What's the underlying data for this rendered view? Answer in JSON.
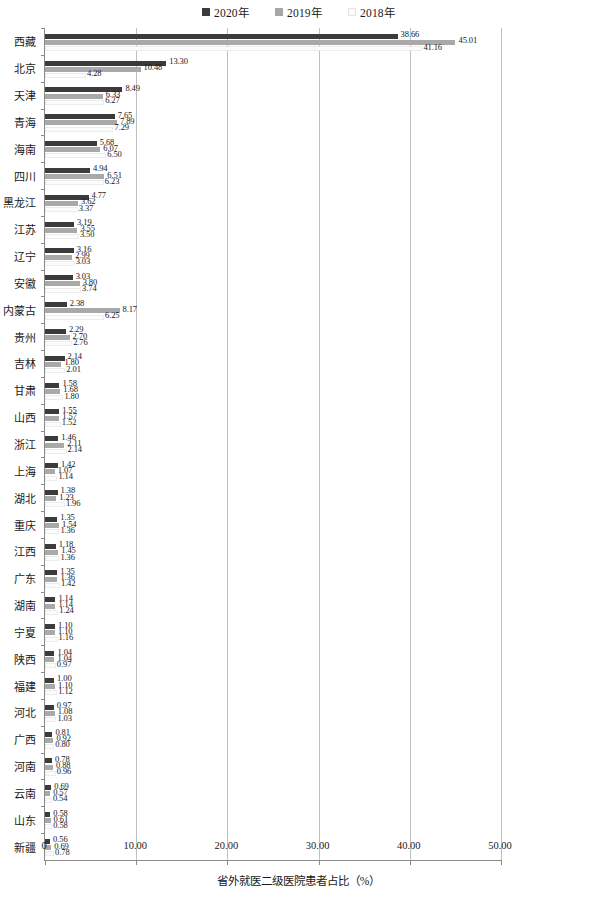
{
  "legend": {
    "items": [
      {
        "label": "2020年",
        "color": "#3b3b3b",
        "icon": "legend-swatch-2020"
      },
      {
        "label": "2019年",
        "color": "#a6a6a6",
        "icon": "legend-swatch-2019"
      },
      {
        "label": "2018年",
        "color": "#fbfbfb",
        "icon": "legend-swatch-2018"
      }
    ]
  },
  "axis": {
    "x_title": "省外就医二级医院患者占比（%）",
    "x_ticks": [
      "0",
      "10.00",
      "20.00",
      "30.00",
      "40.00",
      "50.00"
    ]
  },
  "chart_data": {
    "type": "bar",
    "orientation": "horizontal",
    "title": "",
    "xlabel": "省外就医二级医院患者占比（%）",
    "ylabel": "",
    "xlim": [
      0,
      50
    ],
    "xticks": [
      0,
      10,
      20,
      30,
      40,
      50
    ],
    "grid": true,
    "legend_position": "top-center",
    "categories": [
      "西藏",
      "北京",
      "天津",
      "青海",
      "海南",
      "四川",
      "黑龙江",
      "江苏",
      "辽宁",
      "安徽",
      "内蒙古",
      "贵州",
      "吉林",
      "甘肃",
      "山西",
      "浙江",
      "上海",
      "湖北",
      "重庆",
      "江西",
      "广东",
      "湖南",
      "宁夏",
      "陕西",
      "福建",
      "河北",
      "广西",
      "河南",
      "云南",
      "山东",
      "新疆"
    ],
    "series": [
      {
        "name": "2020年",
        "color": "#3b3b3b",
        "values": [
          38.66,
          13.3,
          8.49,
          7.65,
          5.68,
          4.94,
          4.77,
          3.19,
          3.16,
          3.03,
          2.38,
          2.29,
          2.14,
          1.58,
          1.55,
          1.46,
          1.42,
          1.38,
          1.35,
          1.18,
          1.35,
          1.14,
          1.1,
          1.04,
          1.0,
          0.97,
          0.81,
          0.78,
          0.69,
          0.58,
          0.56
        ]
      },
      {
        "name": "2019年",
        "color": "#a9a9a9",
        "values": [
          45.01,
          10.48,
          6.33,
          7.89,
          6.07,
          6.51,
          3.62,
          3.55,
          2.99,
          3.8,
          8.17,
          2.7,
          1.8,
          1.68,
          1.57,
          2.11,
          1.07,
          1.23,
          1.54,
          1.45,
          1.36,
          1.14,
          1.1,
          1.04,
          1.1,
          1.08,
          0.92,
          0.88,
          0.57,
          0.61,
          0.69
        ]
      },
      {
        "name": "2018年",
        "color": "#fcfcfc",
        "values": [
          41.16,
          4.28,
          6.27,
          7.29,
          6.5,
          6.23,
          3.37,
          3.5,
          3.03,
          3.74,
          6.25,
          2.76,
          2.01,
          1.8,
          1.52,
          2.14,
          1.14,
          1.96,
          1.36,
          1.36,
          1.42,
          1.24,
          1.16,
          0.97,
          1.12,
          1.03,
          0.8,
          0.96,
          0.54,
          0.58,
          0.78
        ]
      }
    ]
  }
}
